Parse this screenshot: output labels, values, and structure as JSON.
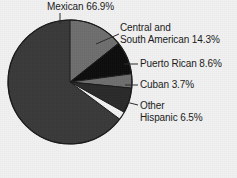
{
  "chart_data": {
    "type": "pie",
    "title": "",
    "categories": [
      "Mexican",
      "Central and South American",
      "Puerto Rican",
      "Cuban",
      "Other Hispanic"
    ],
    "values": [
      66.9,
      14.3,
      8.6,
      3.7,
      6.5
    ],
    "value_unit": "%",
    "legend": "none",
    "labels_position": "outside-with-leader-lines",
    "start_angle_deg": 0,
    "direction": "clockwise",
    "slices": [
      {
        "name": "Mexican",
        "value": 66.9,
        "label": "Mexican 66.9%",
        "label_lines": [
          "Mexican 66.9%"
        ],
        "color": "#3a3a3a",
        "start_deg": 126.72,
        "end_deg": 367.56
      },
      {
        "name": "Central and South American",
        "value": 14.3,
        "label": "Central and South American 14.3%",
        "label_lines": [
          "Central and",
          "South American 14.3%"
        ],
        "color": "#6e6e6e",
        "start_deg": 0,
        "end_deg": 51.48
      },
      {
        "name": "Puerto Rican",
        "value": 8.6,
        "label": "Puerto Rican 8.6%",
        "label_lines": [
          "Puerto Rican 8.6%"
        ],
        "color": "#0d0d0d",
        "start_deg": 51.48,
        "end_deg": 82.44
      },
      {
        "name": "Cuban",
        "value": 3.7,
        "label": "Cuban 3.7%",
        "label_lines": [
          "Cuban 3.7%"
        ],
        "color": "#6e6e6e",
        "start_deg": 82.44,
        "end_deg": 95.76
      },
      {
        "name": "Other Hispanic",
        "value": 6.5,
        "label": "Other Hispanic 6.5%",
        "label_lines": [
          "Other",
          "Hispanic 6.5%"
        ],
        "color": "#2a2a2a",
        "start_deg": 95.76,
        "end_deg": 119.16
      }
    ],
    "colors": {
      "background": "#f1f1f1",
      "outline": "#1a1a1a",
      "text": "#1a1a1a",
      "leader_line": "#2b2b2b"
    },
    "geometry": {
      "center_x": 70,
      "center_y": 82,
      "radius": 62
    }
  },
  "labels": {
    "mexican_line1": "Mexican 66.9%",
    "central_line1": "Central and",
    "central_line2": "South American 14.3%",
    "puertorican_line1": "Puerto Rican 8.6%",
    "cuban_line1": "Cuban 3.7%",
    "other_line1": "Other",
    "other_line2": "Hispanic 6.5%"
  }
}
